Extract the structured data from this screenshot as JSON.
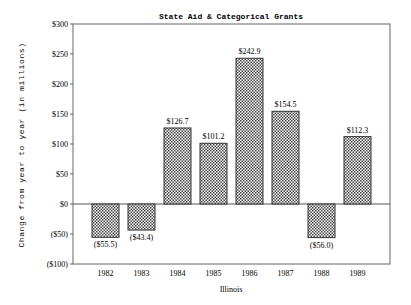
{
  "chart_data": {
    "type": "bar",
    "title": "State Aid & Categorical Grants",
    "xlabel": "Illinois",
    "ylabel": "Change from year to year (in millions)",
    "categories": [
      "1982",
      "1983",
      "1984",
      "1985",
      "1986",
      "1987",
      "1988",
      "1989"
    ],
    "values": [
      -55.5,
      -43.4,
      126.7,
      101.2,
      242.9,
      154.5,
      -56.0,
      112.3
    ],
    "value_labels": [
      "($55.5)",
      "($43.4)",
      "$126.7",
      "$101.2",
      "$242.9",
      "$154.5",
      "($56.0)",
      "$112.3"
    ],
    "ylim": [
      -100,
      300
    ],
    "yticks": [
      300,
      250,
      200,
      150,
      100,
      50,
      0,
      -50,
      -100
    ],
    "ytick_labels": [
      "$300",
      "$250",
      "$200",
      "$150",
      "$100",
      "$50",
      "$0",
      "($50)",
      "($100)"
    ],
    "grid": false,
    "legend": null,
    "bar_fill": "crosshatch",
    "colors": {
      "bar_stroke": "#333333",
      "hatch": "#444444",
      "axis": "#555555",
      "background": "#ffffff"
    }
  }
}
